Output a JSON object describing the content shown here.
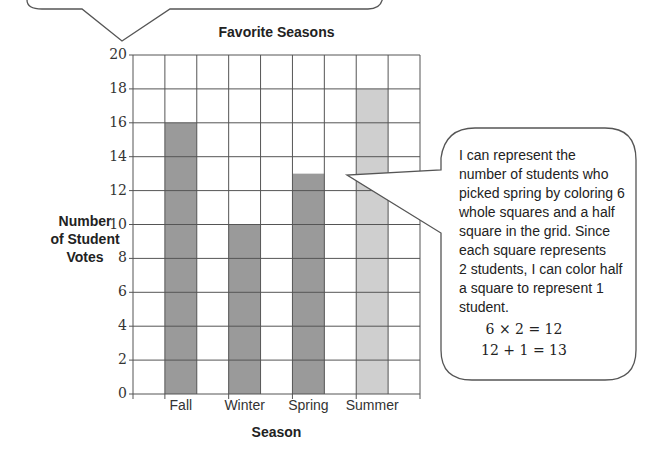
{
  "chart_data": {
    "type": "bar",
    "title": "Favorite Seasons",
    "xlabel": "Season",
    "ylabel": "Number of Student Votes",
    "categories": [
      "Fall",
      "Winter",
      "Spring",
      "Summer"
    ],
    "values": [
      16,
      10,
      13,
      18
    ],
    "ylim": [
      0,
      20
    ],
    "yticks": [
      0,
      2,
      4,
      6,
      8,
      10,
      12,
      14,
      16,
      18,
      20
    ],
    "grid": true,
    "bar_colors": [
      "#9a9a9a",
      "#9a9a9a",
      "#9a9a9a",
      "#cfcfcf"
    ]
  },
  "labels": {
    "title": "Favorite Seasons",
    "xlabel": "Season",
    "ylabel_lines": [
      "Number",
      "of Student",
      "Votes"
    ],
    "categories": [
      "Fall",
      "Winter",
      "Spring",
      "Summer"
    ],
    "yticks": [
      "0",
      "2",
      "4",
      "6",
      "8",
      "10",
      "12",
      "14",
      "16",
      "18",
      "20"
    ]
  },
  "callout": {
    "lines": [
      "I can represent the",
      "number of students who",
      "picked spring by coloring 6",
      "whole squares and a half",
      "square in the grid.  Since",
      "each square represents",
      "2 students, I can color half",
      "a square to represent 1",
      "student."
    ],
    "equations": [
      "6 × 2 = 12",
      "12 + 1 = 13"
    ]
  }
}
